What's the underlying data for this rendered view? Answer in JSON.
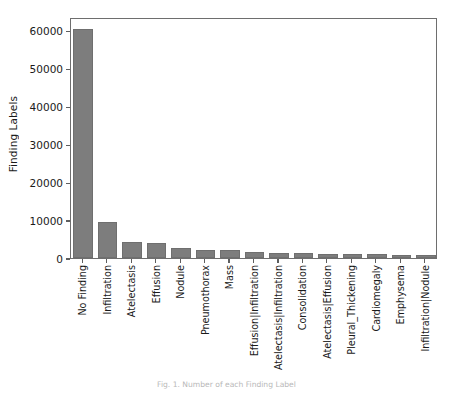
{
  "figure": {
    "caption": "Fig. 1. Number of each Finding Label",
    "bar_color": "#7d7d7d",
    "frame_color": "#6e6e6e"
  },
  "chart_data": {
    "type": "bar",
    "title": "",
    "xlabel": "",
    "ylabel": "Finding Labels",
    "ylim": [
      0,
      63500
    ],
    "yticks": [
      0,
      10000,
      20000,
      30000,
      40000,
      50000,
      60000
    ],
    "ytick_labels": [
      "0",
      "10000",
      "20000",
      "30000",
      "40000",
      "50000",
      "60000"
    ],
    "grid": false,
    "legend": null,
    "categories": [
      "No Finding",
      "Infiltration",
      "Atelectasis",
      "Effusion",
      "Nodule",
      "Pneumothorax",
      "Mass",
      "Effusion|Infiltration",
      "Atelectasis|Infiltration",
      "Consolidation",
      "Atelectasis|Effusion",
      "Pleural_Thickening",
      "Cardiomegaly",
      "Emphysema",
      "Infiltration|Nodule"
    ],
    "values": [
      60361,
      9547,
      4215,
      3955,
      2705,
      2194,
      2139,
      1603,
      1350,
      1310,
      1165,
      1143,
      1093,
      892,
      815
    ]
  }
}
